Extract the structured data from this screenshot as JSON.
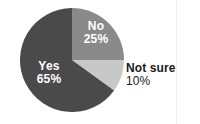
{
  "chart_data": {
    "type": "pie",
    "title": "",
    "subtitle": "",
    "xlabel": "",
    "ylabel": "",
    "legend_position": "none",
    "grid": false,
    "start_angle_deg": 0,
    "direction": "clockwise",
    "categories": [
      "No",
      "Not sure",
      "Yes"
    ],
    "values": [
      25,
      10,
      65
    ],
    "value_unit": "%",
    "slices": [
      {
        "label": "No",
        "value": 25,
        "value_label": "25%",
        "color": "#8a8a8a",
        "label_color": "#ffffff",
        "label_placement": "inside",
        "start_angle_deg": 0,
        "end_angle_deg": 90
      },
      {
        "label": "Not sure",
        "value": 10,
        "value_label": "10%",
        "color": "#c8c8c8",
        "label_color": "#1a1a1a",
        "label_placement": "outside",
        "start_angle_deg": 90,
        "end_angle_deg": 126
      },
      {
        "label": "Yes",
        "value": 65,
        "value_label": "65%",
        "color": "#4a4a4a",
        "label_color": "#ffffff",
        "label_placement": "inside",
        "start_angle_deg": 126,
        "end_angle_deg": 360
      }
    ]
  },
  "figure": {
    "background_color": "#ffffff",
    "center_x": 72,
    "center_y": 60,
    "radius": 52
  }
}
